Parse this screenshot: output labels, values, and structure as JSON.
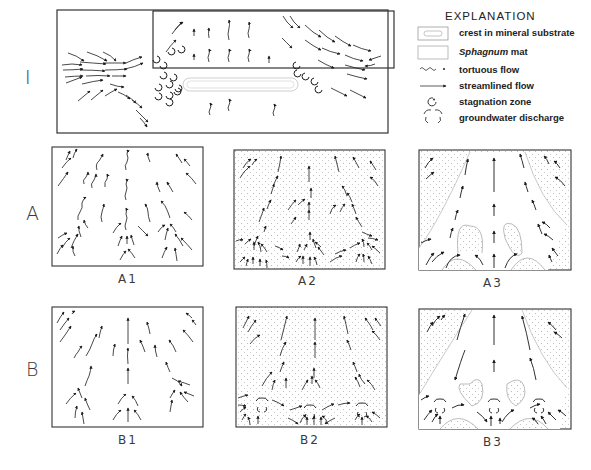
{
  "figure": {
    "row_labels": {
      "I": "I",
      "A": "A",
      "B": "B"
    },
    "panels": [
      {
        "id": "I",
        "label": "",
        "type": "plan-view"
      },
      {
        "id": "A1",
        "label": "A1"
      },
      {
        "id": "A2",
        "label": "A2"
      },
      {
        "id": "A3",
        "label": "A3"
      },
      {
        "id": "B1",
        "label": "B1"
      },
      {
        "id": "B2",
        "label": "B2"
      },
      {
        "id": "B3",
        "label": "B3"
      }
    ]
  },
  "legend": {
    "title": "EXPLANATION",
    "items": [
      {
        "symbol": "crest-icon",
        "label": "crest in mineral substrate"
      },
      {
        "symbol": "sphagnum-icon",
        "label_italic": "Sphagnum",
        "label_rest": " mat"
      },
      {
        "symbol": "tortuous-flow-icon",
        "label": "tortuous flow"
      },
      {
        "symbol": "streamlined-flow-icon",
        "label": "streamlined flow"
      },
      {
        "symbol": "stagnation-icon",
        "label": "stagnation zone"
      },
      {
        "symbol": "discharge-icon",
        "label": "groundwater discharge"
      }
    ]
  },
  "colors": {
    "ink": "#1a1a1a",
    "stipple": "#b8b8b8",
    "crest": "#c8c8c8",
    "background": "#ffffff"
  }
}
